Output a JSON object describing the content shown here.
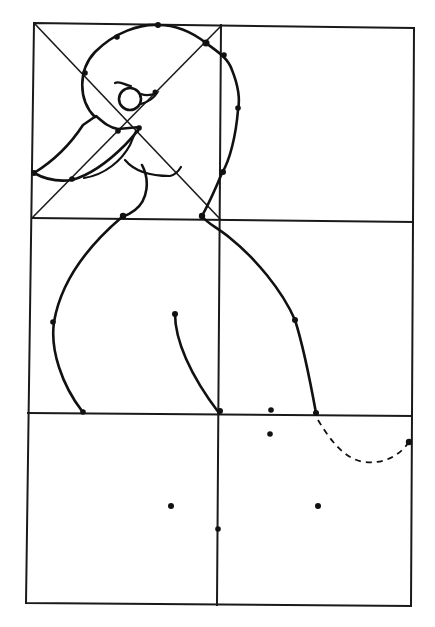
{
  "figure": {
    "type": "grid-drawing-guide",
    "grid": {
      "columns": 2,
      "rows": 3,
      "top_left_cell_has_diagonals": true
    },
    "colors": {
      "background": "#ffffff",
      "ink": "#111111"
    },
    "elements": [
      "head-outline",
      "eye",
      "beak",
      "neck-and-back",
      "chest",
      "wing-line",
      "tail-guide-dashed",
      "guide-dots"
    ]
  }
}
